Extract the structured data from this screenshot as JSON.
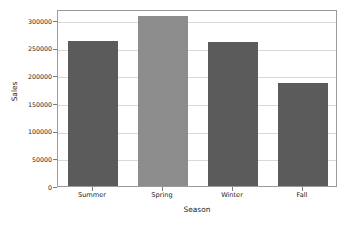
{
  "chart_data": {
    "type": "bar",
    "title": "",
    "xlabel": "Season",
    "ylabel": "Sales",
    "categories": [
      "Summer",
      "Spring",
      "Winter",
      "Fall"
    ],
    "values": [
      263000,
      307000,
      261000,
      187000
    ],
    "series": [
      {
        "name": "Sales",
        "values": [
          263000,
          307000,
          261000,
          187000
        ]
      }
    ],
    "ylim": [
      0,
      320000
    ],
    "yticks": [
      0,
      50000,
      100000,
      150000,
      200000,
      250000,
      300000
    ],
    "ytick_labels": [
      "0",
      "50000",
      "100000",
      "150000",
      "200000",
      "250000",
      "300000"
    ],
    "xtick_labels": [
      "Summer",
      "Spring",
      "Winter",
      "Fall"
    ],
    "grid": true,
    "grid_axis": "y",
    "legend": false,
    "legend_position": "none",
    "bar_colors": [
      "#5b5b5b",
      "#8c8c8c",
      "#5b5b5b",
      "#5b5b5b"
    ],
    "plot_background": "#ffffff",
    "figure_background": "#ffffff",
    "grid_color": "#d9d9d9",
    "frame_color": "#9a9a9a",
    "annotations": []
  }
}
